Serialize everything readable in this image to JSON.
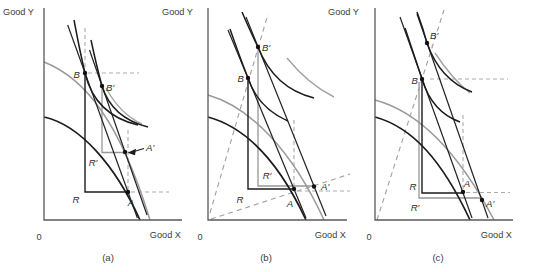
{
  "colors": {
    "curve_black": "#1c1c1c",
    "curve_gray": "#9a9a9a",
    "dashed_gray": "#ababab",
    "axis_gray": "#5a5a5a",
    "text_gray": "#3c3c3c"
  },
  "panels": [
    {
      "caption": "(a)",
      "y_axis_label": "Good Y",
      "x_axis_label": "Good X",
      "origin_label": "0",
      "points": {
        "B": "B",
        "B_prime": "B′",
        "A": "A",
        "A_prime": "A′",
        "R": "R",
        "R_prime": "R′"
      }
    },
    {
      "caption": "(b)",
      "y_axis_label": "Good Y",
      "x_axis_label": "Good X",
      "origin_label": "0",
      "points": {
        "B": "B",
        "B_prime": "B′",
        "A": "A",
        "A_prime": "A′",
        "R": "R",
        "R_prime": "R′"
      }
    },
    {
      "caption": "(c)",
      "y_axis_label": "Good Y",
      "x_axis_label": "Good X",
      "origin_label": "0",
      "points": {
        "B": "B",
        "B_prime": "B′",
        "A": "A",
        "A_prime": "A′",
        "R": "R",
        "R_prime": "R′"
      }
    }
  ]
}
